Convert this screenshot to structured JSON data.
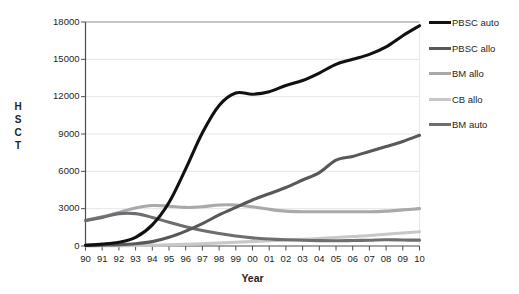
{
  "chart_data": {
    "type": "line",
    "title": "",
    "xlabel": "Year",
    "ylabel": "HSCT",
    "ylabel_letters": [
      "H",
      "S",
      "C",
      "T"
    ],
    "x": [
      "90",
      "91",
      "92",
      "93",
      "94",
      "95",
      "96",
      "97",
      "98",
      "99",
      "00",
      "01",
      "02",
      "03",
      "04",
      "05",
      "06",
      "07",
      "08",
      "09",
      "10"
    ],
    "xlim": [
      1990,
      2010
    ],
    "ylim": [
      0,
      18000
    ],
    "yticks": [
      0,
      3000,
      6000,
      9000,
      12000,
      15000,
      18000
    ],
    "ytick_labels": [
      "0",
      "3000",
      "6000",
      "9000",
      "12000",
      "15000",
      "18000"
    ],
    "grid": true,
    "legend_position": "right",
    "series": [
      {
        "name": "PBSC auto",
        "color": "#111111",
        "width": 3.1,
        "values": [
          60,
          150,
          300,
          700,
          1700,
          3500,
          6200,
          9100,
          11300,
          12300,
          12200,
          12400,
          12900,
          13300,
          13900,
          14600,
          15000,
          15400,
          16000,
          16900,
          17700
        ]
      },
      {
        "name": "PBSC allo",
        "color": "#58585a",
        "width": 3.1,
        "values": [
          50,
          70,
          100,
          180,
          350,
          700,
          1200,
          1800,
          2500,
          3100,
          3700,
          4200,
          4700,
          5300,
          5900,
          6900,
          7200,
          7600,
          8000,
          8400,
          8900
        ]
      },
      {
        "name": "BM allo",
        "color": "#a7a9ac",
        "width": 3.1,
        "values": [
          2050,
          2350,
          2700,
          3050,
          3250,
          3200,
          3100,
          3150,
          3300,
          3300,
          3150,
          2950,
          2800,
          2750,
          2750,
          2750,
          2750,
          2750,
          2800,
          2900,
          3000
        ]
      },
      {
        "name": "CB allo",
        "color": "#c7c8ca",
        "width": 3.1,
        "values": [
          10,
          15,
          25,
          40,
          60,
          90,
          130,
          180,
          240,
          300,
          360,
          420,
          480,
          540,
          600,
          680,
          760,
          840,
          950,
          1050,
          1150
        ]
      },
      {
        "name": "BM auto",
        "color": "#6d6e71",
        "width": 3.1,
        "values": [
          2050,
          2300,
          2600,
          2600,
          2300,
          1900,
          1550,
          1250,
          1000,
          800,
          650,
          560,
          500,
          460,
          430,
          420,
          440,
          460,
          500,
          480,
          470
        ]
      }
    ]
  },
  "legend": {
    "items": [
      {
        "label": "PBSC auto",
        "color": "#111111"
      },
      {
        "label": "PBSC allo",
        "color": "#58585a"
      },
      {
        "label": "BM allo",
        "color": "#a7a9ac"
      },
      {
        "label": "CB allo",
        "color": "#c7c8ca"
      },
      {
        "label": "BM auto",
        "color": "#6d6e71"
      }
    ]
  },
  "axes": {
    "x_title": "Year",
    "y_title": "HSCT"
  }
}
